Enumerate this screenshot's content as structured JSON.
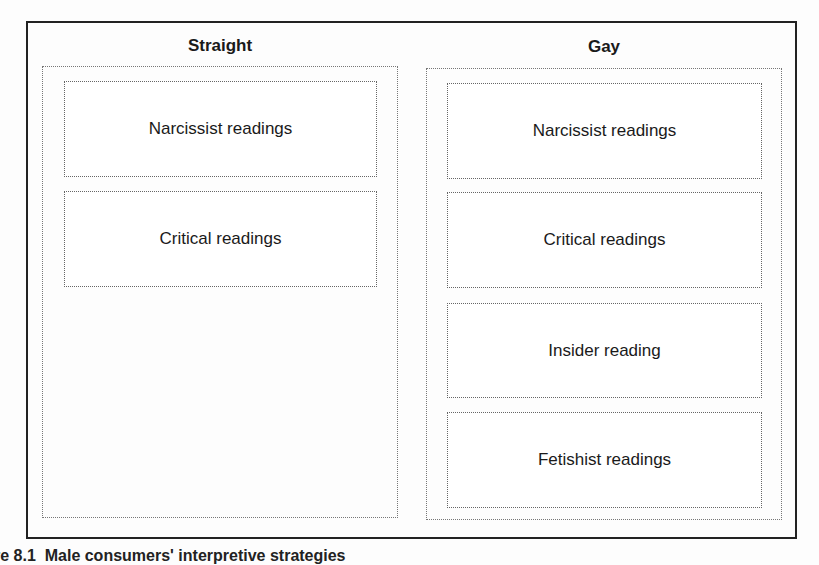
{
  "diagram": {
    "columns": [
      {
        "title": "Straight",
        "items": [
          "Narcissist readings",
          "Critical readings"
        ]
      },
      {
        "title": "Gay",
        "items": [
          "Narcissist readings",
          "Critical readings",
          "Insider reading",
          "Fetishist readings"
        ]
      }
    ],
    "caption": {
      "label": "re 8.1",
      "text": "Male consumers' interpretive strategies"
    }
  }
}
